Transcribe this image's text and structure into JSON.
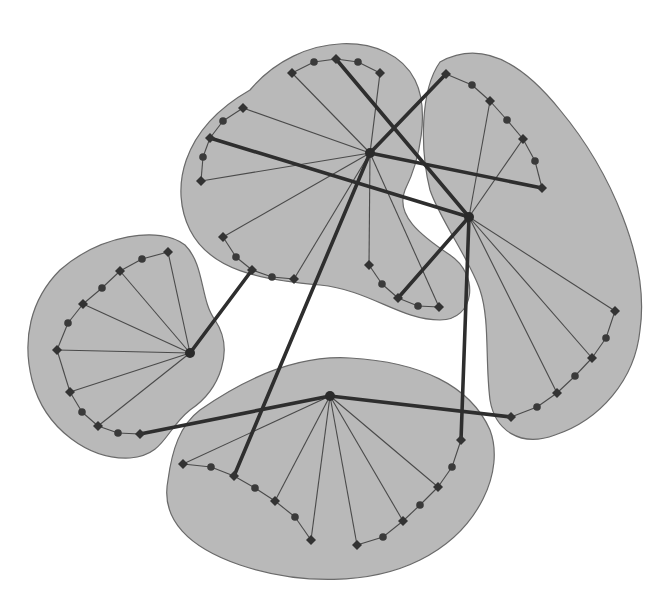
{
  "diagram": {
    "type": "clustered-graph",
    "style": {
      "background": "#ffffff",
      "cluster_fill": "#b9b9b9",
      "cluster_stroke": "#6a6a6a",
      "edge_color": "#2e2e2e",
      "node_color": "#333333"
    },
    "clusters": [
      {
        "id": "top",
        "hub": [
          370,
          153
        ],
        "path": "M 250 90 C 300 30, 390 30, 415 80 C 430 110, 420 160, 405 190 C 395 215, 420 235, 450 255 C 480 275, 475 320, 440 320 C 400 320, 370 290, 320 285 C 260 280, 210 270, 190 230 C 170 190, 180 130, 250 90 Z",
        "ring_nodes": [
          {
            "x": 292,
            "y": 73,
            "shape": "diamond"
          },
          {
            "x": 314,
            "y": 62,
            "shape": "circle"
          },
          {
            "x": 336,
            "y": 59,
            "shape": "diamond"
          },
          {
            "x": 358,
            "y": 62,
            "shape": "circle"
          },
          {
            "x": 380,
            "y": 73,
            "shape": "diamond"
          },
          {
            "x": 243,
            "y": 108,
            "shape": "diamond"
          },
          {
            "x": 223,
            "y": 121,
            "shape": "circle"
          },
          {
            "x": 210,
            "y": 138,
            "shape": "diamond"
          },
          {
            "x": 203,
            "y": 157,
            "shape": "circle"
          },
          {
            "x": 201,
            "y": 181,
            "shape": "diamond"
          },
          {
            "x": 223,
            "y": 237,
            "shape": "diamond"
          },
          {
            "x": 236,
            "y": 257,
            "shape": "circle"
          },
          {
            "x": 252,
            "y": 270,
            "shape": "diamond"
          },
          {
            "x": 272,
            "y": 277,
            "shape": "circle"
          },
          {
            "x": 294,
            "y": 279,
            "shape": "diamond"
          },
          {
            "x": 369,
            "y": 265,
            "shape": "diamond"
          },
          {
            "x": 382,
            "y": 284,
            "shape": "circle"
          },
          {
            "x": 398,
            "y": 298,
            "shape": "diamond"
          },
          {
            "x": 418,
            "y": 306,
            "shape": "circle"
          },
          {
            "x": 439,
            "y": 307,
            "shape": "diamond"
          }
        ],
        "spokes": [
          [
            292,
            73
          ],
          [
            380,
            73
          ],
          [
            243,
            108
          ],
          [
            201,
            181
          ],
          [
            223,
            237
          ],
          [
            294,
            279
          ],
          [
            369,
            265
          ],
          [
            439,
            307
          ]
        ]
      },
      {
        "id": "right",
        "hub": [
          469,
          217
        ],
        "path": "M 440 62 C 480 40, 520 60, 560 110 C 610 170, 650 260, 640 330 C 635 380, 600 420, 555 435 C 520 448, 495 430, 490 400 C 485 360, 490 320, 480 290 C 470 260, 440 220, 430 190 C 420 150, 420 90, 440 62 Z",
        "ring_nodes": [
          {
            "x": 446,
            "y": 74,
            "shape": "diamond"
          },
          {
            "x": 472,
            "y": 85,
            "shape": "circle"
          },
          {
            "x": 490,
            "y": 101,
            "shape": "diamond"
          },
          {
            "x": 507,
            "y": 120,
            "shape": "circle"
          },
          {
            "x": 523,
            "y": 139,
            "shape": "diamond"
          },
          {
            "x": 535,
            "y": 161,
            "shape": "circle"
          },
          {
            "x": 542,
            "y": 188,
            "shape": "diamond"
          },
          {
            "x": 615,
            "y": 311,
            "shape": "diamond"
          },
          {
            "x": 606,
            "y": 338,
            "shape": "circle"
          },
          {
            "x": 592,
            "y": 358,
            "shape": "diamond"
          },
          {
            "x": 575,
            "y": 376,
            "shape": "circle"
          },
          {
            "x": 557,
            "y": 393,
            "shape": "diamond"
          },
          {
            "x": 537,
            "y": 407,
            "shape": "circle"
          },
          {
            "x": 511,
            "y": 417,
            "shape": "diamond"
          }
        ],
        "spokes": [
          [
            490,
            101
          ],
          [
            523,
            139
          ],
          [
            615,
            311
          ],
          [
            592,
            358
          ],
          [
            557,
            393
          ]
        ]
      },
      {
        "id": "left",
        "hub": [
          190,
          353
        ],
        "path": "M 60 270 C 100 235, 160 225, 185 245 C 205 265, 200 300, 215 320 C 235 350, 220 390, 190 410 C 165 430, 165 455, 130 458 C 90 460, 45 430, 32 380 C 22 340, 30 300, 60 270 Z",
        "ring_nodes": [
          {
            "x": 168,
            "y": 252,
            "shape": "diamond"
          },
          {
            "x": 142,
            "y": 259,
            "shape": "circle"
          },
          {
            "x": 120,
            "y": 271,
            "shape": "diamond"
          },
          {
            "x": 102,
            "y": 288,
            "shape": "circle"
          },
          {
            "x": 83,
            "y": 304,
            "shape": "diamond"
          },
          {
            "x": 68,
            "y": 323,
            "shape": "circle"
          },
          {
            "x": 57,
            "y": 350,
            "shape": "diamond"
          },
          {
            "x": 70,
            "y": 392,
            "shape": "diamond"
          },
          {
            "x": 82,
            "y": 412,
            "shape": "circle"
          },
          {
            "x": 98,
            "y": 426,
            "shape": "diamond"
          },
          {
            "x": 118,
            "y": 433,
            "shape": "circle"
          },
          {
            "x": 140,
            "y": 434,
            "shape": "diamond"
          }
        ],
        "spokes": [
          [
            168,
            252
          ],
          [
            120,
            271
          ],
          [
            83,
            304
          ],
          [
            57,
            350
          ],
          [
            70,
            392
          ],
          [
            98,
            426
          ]
        ]
      },
      {
        "id": "bottom",
        "hub": [
          330,
          396
        ],
        "path": "M 200 410 C 250 375, 300 355, 350 358 C 420 362, 470 385, 490 430 C 505 470, 480 530, 420 560 C 370 585, 300 585, 240 565 C 190 548, 160 520, 168 480 C 172 450, 180 425, 200 410 Z",
        "ring_nodes": [
          {
            "x": 183,
            "y": 464,
            "shape": "diamond"
          },
          {
            "x": 211,
            "y": 467,
            "shape": "circle"
          },
          {
            "x": 234,
            "y": 476,
            "shape": "diamond"
          },
          {
            "x": 255,
            "y": 488,
            "shape": "circle"
          },
          {
            "x": 275,
            "y": 501,
            "shape": "diamond"
          },
          {
            "x": 295,
            "y": 517,
            "shape": "circle"
          },
          {
            "x": 311,
            "y": 540,
            "shape": "diamond"
          },
          {
            "x": 357,
            "y": 545,
            "shape": "diamond"
          },
          {
            "x": 383,
            "y": 537,
            "shape": "circle"
          },
          {
            "x": 403,
            "y": 521,
            "shape": "diamond"
          },
          {
            "x": 420,
            "y": 505,
            "shape": "circle"
          },
          {
            "x": 438,
            "y": 487,
            "shape": "diamond"
          },
          {
            "x": 452,
            "y": 467,
            "shape": "circle"
          },
          {
            "x": 461,
            "y": 440,
            "shape": "diamond"
          }
        ],
        "spokes": [
          [
            183,
            464
          ],
          [
            275,
            501
          ],
          [
            311,
            540
          ],
          [
            357,
            545
          ],
          [
            403,
            521
          ],
          [
            438,
            487
          ]
        ]
      }
    ],
    "inter_cluster_edges": [
      {
        "from": [
          336,
          59
        ],
        "to": [
          469,
          217
        ]
      },
      {
        "from": [
          370,
          153
        ],
        "to": [
          446,
          74
        ]
      },
      {
        "from": [
          210,
          138
        ],
        "to": [
          469,
          217
        ]
      },
      {
        "from": [
          370,
          153
        ],
        "to": [
          542,
          188
        ]
      },
      {
        "from": [
          370,
          153
        ],
        "to": [
          234,
          476
        ]
      },
      {
        "from": [
          469,
          217
        ],
        "to": [
          398,
          298
        ]
      },
      {
        "from": [
          469,
          217
        ],
        "to": [
          461,
          440
        ]
      },
      {
        "from": [
          190,
          353
        ],
        "to": [
          252,
          270
        ]
      },
      {
        "from": [
          140,
          434
        ],
        "to": [
          330,
          396
        ]
      },
      {
        "from": [
          330,
          396
        ],
        "to": [
          511,
          417
        ]
      }
    ]
  }
}
